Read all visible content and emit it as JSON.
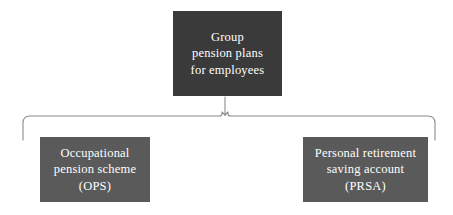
{
  "diagram": {
    "type": "hierarchy-tree",
    "title_visible": false,
    "background_color": "#ffffff",
    "connector": {
      "style": "curly-brace",
      "stroke_color": "#8a8a8a",
      "apex_x": 225,
      "rail_y": 115,
      "left_end_x": 22,
      "right_end_x": 436
    },
    "nodes": [
      {
        "id": "root",
        "role": "parent",
        "fill_color": "#3a3a3a",
        "text_color": "#ffffff",
        "lines": [
          "Group",
          "pension plans",
          "for employees"
        ]
      },
      {
        "id": "ops",
        "role": "child",
        "fill_color": "#5a5a5a",
        "text_color": "#ffffff",
        "lines": [
          "Occupational",
          "pension scheme",
          "(OPS)"
        ]
      },
      {
        "id": "prsa",
        "role": "child",
        "fill_color": "#5a5a5a",
        "text_color": "#ffffff",
        "lines": [
          "Personal retirement",
          "saving account",
          "(PRSA)"
        ]
      }
    ]
  }
}
